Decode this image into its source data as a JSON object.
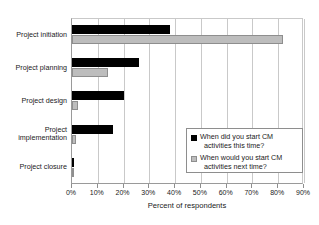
{
  "chart_data": {
    "type": "bar",
    "orientation": "horizontal",
    "title": "",
    "xlabel": "Percent of respondents",
    "ylabel": "",
    "xlim": [
      0,
      90
    ],
    "xtick_labels": [
      "0%",
      "10%",
      "20%",
      "30%",
      "40%",
      "50%",
      "60%",
      "70%",
      "80%",
      "90%"
    ],
    "xtick_values": [
      0,
      10,
      20,
      30,
      40,
      50,
      60,
      70,
      80,
      90
    ],
    "grid": "vertical",
    "legend_position": "bottom-right",
    "categories": [
      "Project initiation",
      "Project planning",
      "Project design",
      "Project implementation",
      "Project closure"
    ],
    "series": [
      {
        "name": "When did you start CM activities this time?",
        "color": "#000000",
        "values": [
          38,
          26,
          20,
          16,
          0.8
        ]
      },
      {
        "name": "When would you start CM activities next time?",
        "color": "#bdbdbd",
        "values": [
          82,
          14,
          2.5,
          1.5,
          0.5
        ]
      }
    ]
  },
  "legend": {
    "entries": [
      {
        "line1": "When did you start CM",
        "line2": "activities this time?"
      },
      {
        "line1": "When would you start CM",
        "line2": "activities next time?"
      }
    ]
  }
}
